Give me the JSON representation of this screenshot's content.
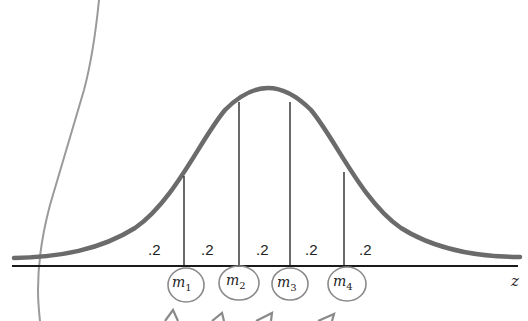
{
  "diagram": {
    "axis_label": "z",
    "area_labels": [
      ".2",
      ".2",
      ".2",
      ".2",
      ".2"
    ],
    "boundaries": [
      {
        "name": "m",
        "sub": "1"
      },
      {
        "name": "m",
        "sub": "2"
      },
      {
        "name": "m",
        "sub": "3"
      },
      {
        "name": "m",
        "sub": "4"
      }
    ],
    "colors": {
      "curve": "#6b6b6b",
      "axis": "#1a1a1a",
      "lines": "#1a1a1a",
      "pencil": "#8a8a8a"
    }
  }
}
